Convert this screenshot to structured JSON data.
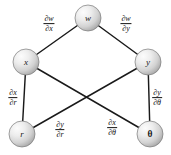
{
  "diagram": {
    "type": "chain-rule-tree",
    "title": "",
    "background_color": "#ffffff",
    "edge_color": "#1a1a1a",
    "node_fill": "#d8d8d8",
    "node_stroke": "#6f6f6f",
    "nodes": [
      {
        "id": "w",
        "label": "w",
        "cx": 88,
        "cy": 18,
        "r": 13,
        "italic": true
      },
      {
        "id": "x",
        "label": "x",
        "cx": 26,
        "cy": 62,
        "r": 13,
        "italic": true
      },
      {
        "id": "y",
        "label": "y",
        "cx": 148,
        "cy": 62,
        "r": 13,
        "italic": true
      },
      {
        "id": "r",
        "label": "r",
        "cx": 22,
        "cy": 134,
        "r": 13,
        "italic": true
      },
      {
        "id": "theta",
        "label": "θ",
        "cx": 150,
        "cy": 134,
        "r": 13,
        "italic": false
      }
    ],
    "edges": [
      {
        "id": "w-x",
        "from": "w",
        "to": "x"
      },
      {
        "id": "w-y",
        "from": "w",
        "to": "y"
      },
      {
        "id": "x-r",
        "from": "x",
        "to": "r"
      },
      {
        "id": "x-theta",
        "from": "x",
        "to": "theta"
      },
      {
        "id": "y-r",
        "from": "y",
        "to": "r"
      },
      {
        "id": "y-theta",
        "from": "y",
        "to": "theta"
      }
    ],
    "edge_labels": [
      {
        "id": "dw-dx",
        "numerator": "∂w",
        "denominator": "∂x",
        "x": 49,
        "y": 24,
        "edge": "w-x"
      },
      {
        "id": "dw-dy",
        "numerator": "∂w",
        "denominator": "∂y",
        "x": 126,
        "y": 24,
        "edge": "w-y"
      },
      {
        "id": "dx-dr",
        "numerator": "∂x",
        "denominator": "∂r",
        "x": 13,
        "y": 98,
        "edge": "x-r"
      },
      {
        "id": "dy-dtheta",
        "numerator": "∂y",
        "denominator": "∂θ",
        "x": 157,
        "y": 98,
        "edge": "y-theta"
      },
      {
        "id": "dy-dr",
        "numerator": "∂y",
        "denominator": "∂r",
        "x": 60,
        "y": 130,
        "edge": "y-r"
      },
      {
        "id": "dx-dtheta",
        "numerator": "∂x",
        "denominator": "∂θ",
        "x": 112,
        "y": 128,
        "edge": "x-theta"
      }
    ]
  }
}
